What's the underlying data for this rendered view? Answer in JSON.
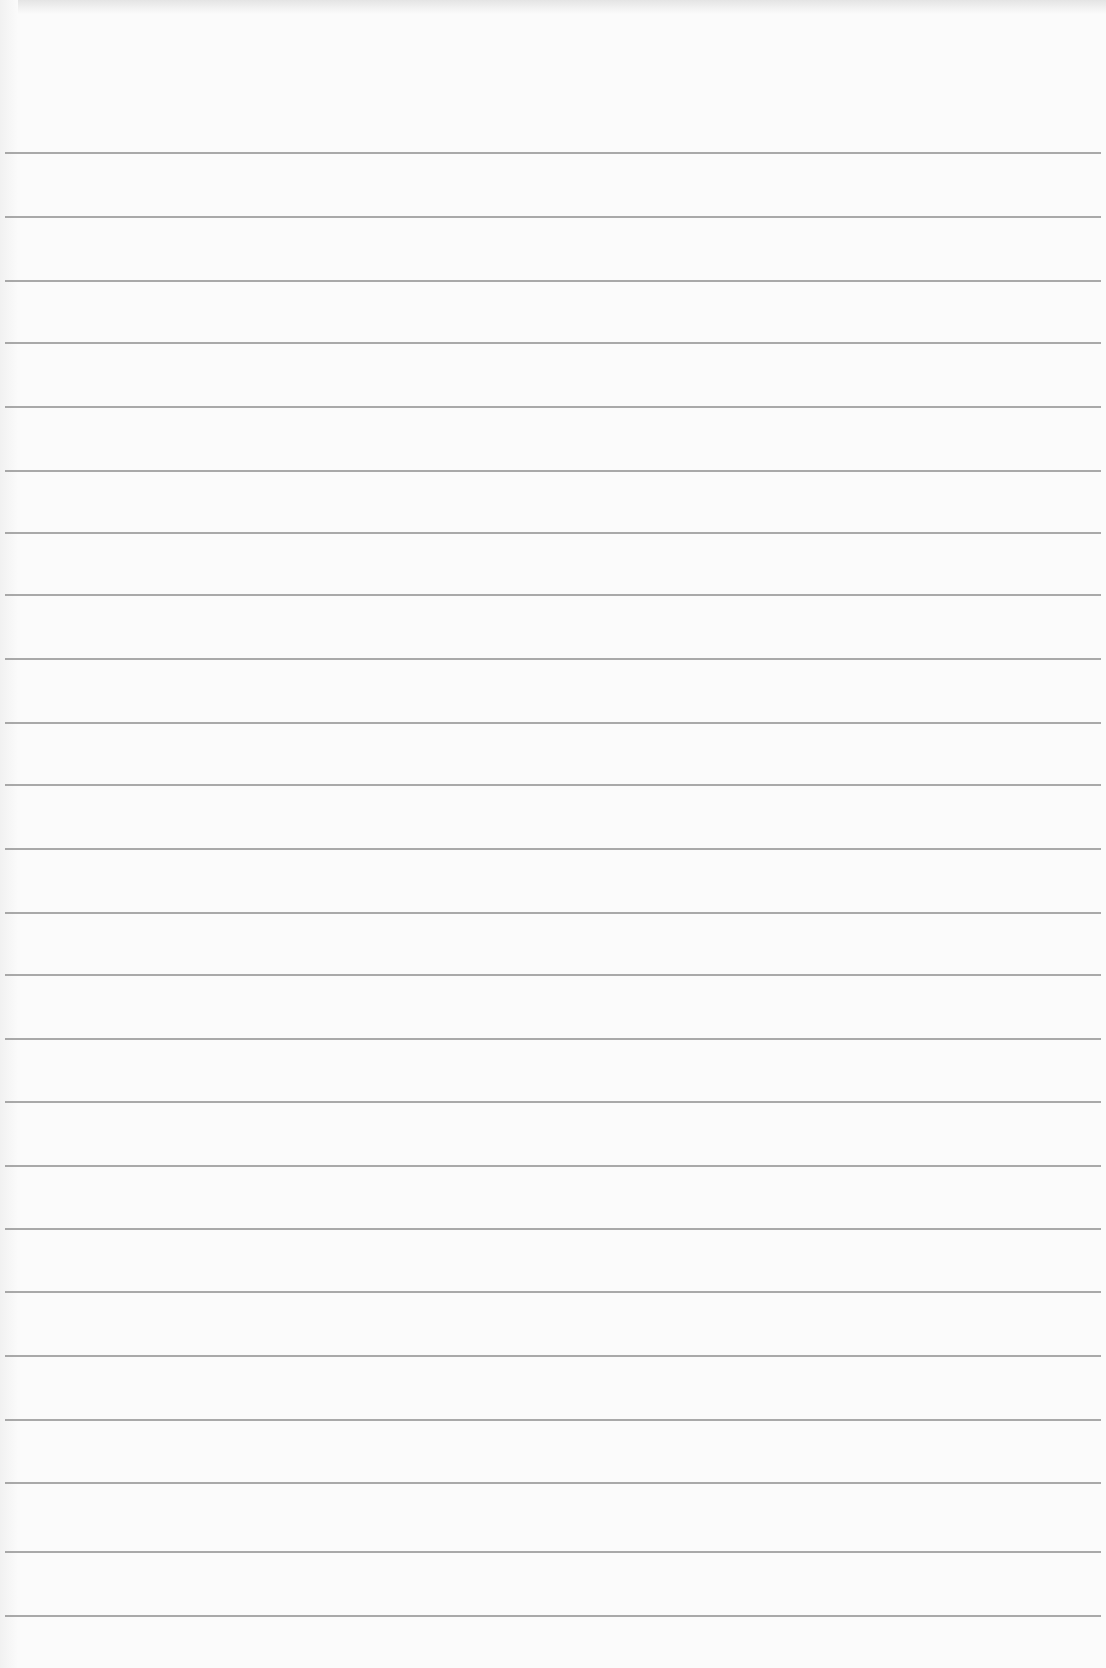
{
  "page": {
    "type": "blank-lined-paper",
    "background_color": "#fbfbfb",
    "rule_color": "#8e8e8e",
    "rule_positions_px": [
      152,
      216,
      280,
      342,
      406,
      470,
      532,
      594,
      658,
      722,
      784,
      848,
      912,
      974,
      1038,
      1101,
      1165,
      1228,
      1291,
      1355,
      1419,
      1482,
      1551,
      1615
    ],
    "text": ""
  }
}
